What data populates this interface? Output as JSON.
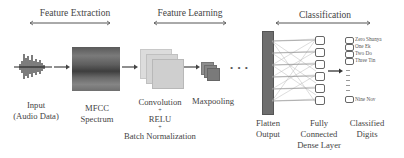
{
  "diagram": {
    "sections": [
      {
        "label": "Feature Extraction"
      },
      {
        "label": "Feature Learning"
      },
      {
        "label": "Classification"
      }
    ],
    "stages": [
      {
        "id": "input",
        "line1": "Input",
        "line2": "(Audio Data)"
      },
      {
        "id": "mfcc",
        "line1": "MFCC",
        "line2": "Spectrum"
      },
      {
        "id": "conv",
        "line1": "Convolution",
        "plus1": "+",
        "line2": "RELU",
        "plus2": "+",
        "line3": "Batch Normalization"
      },
      {
        "id": "pool",
        "line1": "Maxpooling"
      },
      {
        "id": "ellipsis",
        "glyph": "• • •"
      },
      {
        "id": "flatten",
        "line1": "Flatten",
        "line2": "Output"
      },
      {
        "id": "dense",
        "line1": "Fully",
        "line2": "Connected",
        "line3": "Dense Layer"
      },
      {
        "id": "digits",
        "line1": "Classified",
        "line2": "Digits"
      }
    ],
    "classified_digits": [
      "Zero Shunya",
      "One Ek",
      "Two Do",
      "Three Tin",
      "Nine Nov"
    ],
    "dense_nodes": 6,
    "colors": {
      "text": "#444444",
      "arrow": "#555555",
      "spectrum": "#6b6b6b",
      "feature_map": "#d0d0d0",
      "pool_map": "#8a8a8a",
      "flatten_bar": "#6e6e6e"
    }
  }
}
